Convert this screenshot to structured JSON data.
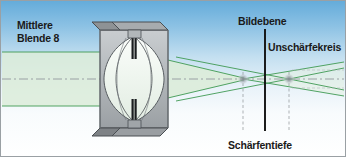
{
  "figure": {
    "width": 346,
    "height": 157,
    "labels": {
      "aperture_line1": "Mittlere",
      "aperture_line2": "Blende 8",
      "image_plane": "Bildebene",
      "circle_of_confusion": "Unschärfekreis",
      "depth_of_field": "Schärfentiefe"
    },
    "colors": {
      "background_top": "#5fa8d8",
      "background_bottom": "#ffffff",
      "ray_stroke": "#3f9a54",
      "ray_fill": "#d9ecd6",
      "lens_glass": "#eef5ef",
      "barrel_body": "#b9bdc0",
      "barrel_shadow": "#8e9295",
      "barrel_outline": "#4a4f53",
      "axis": "#9aa0a4",
      "image_plane_line": "#111111",
      "dof_marker": "#8e9295",
      "coc_blur": "#9aa0a4",
      "text": "#1a1a1a",
      "frame_border": "#9aa0a4"
    },
    "optics": {
      "aperture_value": "f/8",
      "axis_y": 79,
      "lens_center_x": 134,
      "image_plane_x": 265,
      "near_focus_x": 243,
      "far_focus_x": 289,
      "beam_half_height": 27,
      "focus_point_radius": 5,
      "dof_near_marker_x": 243,
      "dof_far_marker_x": 289
    }
  }
}
